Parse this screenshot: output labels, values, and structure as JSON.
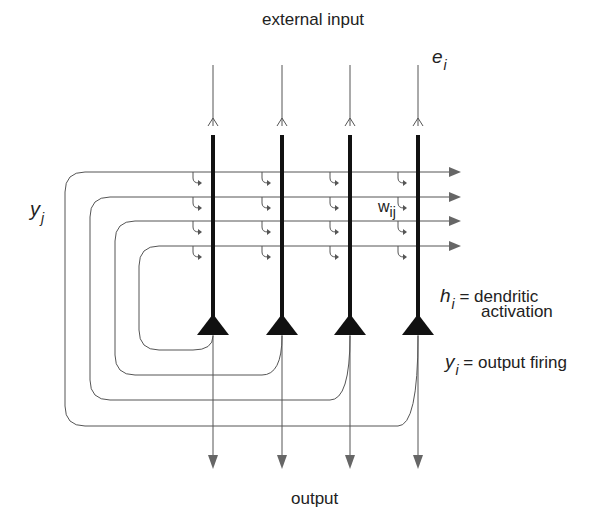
{
  "diagram": {
    "type": "autoassociative-network",
    "labels": {
      "top": "external input",
      "bottom": "output",
      "input_var": "e",
      "input_sub": "i",
      "recurrent_var": "y",
      "recurrent_sub": "j",
      "weight_var": "w",
      "weight_sub": "ij",
      "h_var": "h",
      "h_sub": "i",
      "h_desc_line1": "= dendritic",
      "h_desc_line2": "activation",
      "y_var": "y",
      "y_sub": "i",
      "y_desc": "= output firing"
    },
    "neurons": [
      {
        "id": 1,
        "x": 213,
        "loop_left": 139,
        "loop_y": 246,
        "loop_bottom": 350
      },
      {
        "id": 2,
        "x": 282,
        "loop_left": 115,
        "loop_y": 221,
        "loop_bottom": 375
      },
      {
        "id": 3,
        "x": 350,
        "loop_left": 90,
        "loop_y": 197,
        "loop_bottom": 400
      },
      {
        "id": 4,
        "x": 418,
        "loop_left": 65,
        "loop_y": 172,
        "loop_bottom": 426
      }
    ],
    "colors": {
      "thin_line": "#555555",
      "thick_line": "#111111",
      "soma": "#111111",
      "arrow": "#666666",
      "text": "#222222"
    }
  }
}
